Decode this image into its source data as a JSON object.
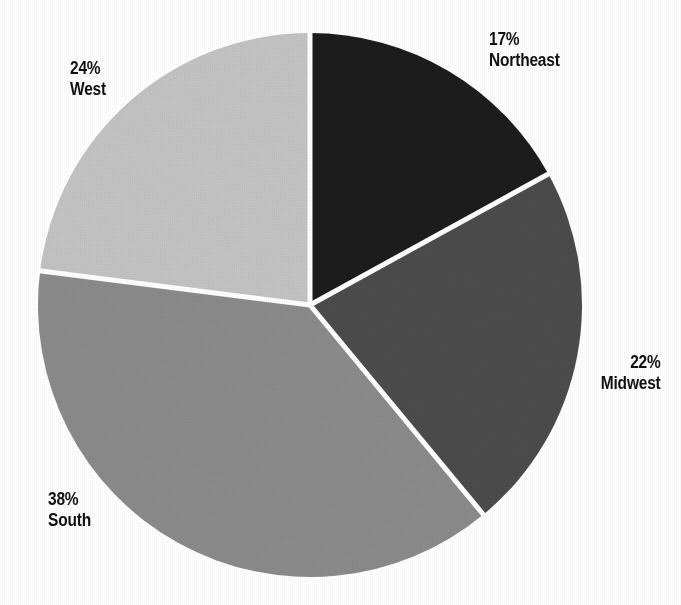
{
  "figure": {
    "background_color": "#ffffff",
    "divider_color": "#ffffff",
    "divider_width_px": 5,
    "center_x": 310,
    "center_y": 305,
    "radius": 272
  },
  "chart_data": {
    "type": "pie",
    "title": "",
    "xlabel": "",
    "ylabel": "",
    "categories": [
      "Northeast",
      "Midwest",
      "South",
      "West"
    ],
    "values": [
      17,
      22,
      38,
      24
    ],
    "value_unit": "%",
    "start_angle_deg": 0,
    "direction": "clockwise",
    "legend_position": "none",
    "grid": false,
    "slices": [
      {
        "name": "Northeast",
        "value": 17,
        "percent_label": "17%",
        "color": "#1c1c1c",
        "start_angle_deg": 0,
        "end_angle_deg": 61.2,
        "label_position": "outside-top-right"
      },
      {
        "name": "Midwest",
        "value": 22,
        "percent_label": "22%",
        "color": "#4d4d4d",
        "start_angle_deg": 61.2,
        "end_angle_deg": 140.4,
        "label_position": "outside-right"
      },
      {
        "name": "South",
        "value": 38,
        "percent_label": "38%",
        "color": "#8d8d8d",
        "start_angle_deg": 140.4,
        "end_angle_deg": 277.2,
        "label_position": "outside-bottom-left"
      },
      {
        "name": "West",
        "value": 24,
        "percent_label": "24%",
        "color": "#c6c6c6",
        "start_angle_deg": 277.2,
        "end_angle_deg": 360,
        "label_position": "outside-top-left"
      }
    ]
  },
  "labels": {
    "northeast": {
      "percent": "17%",
      "name": "Northeast"
    },
    "midwest": {
      "percent": "22%",
      "name": "Midwest"
    },
    "south": {
      "percent": "38%",
      "name": "South"
    },
    "west": {
      "percent": "24%",
      "name": "West"
    }
  }
}
